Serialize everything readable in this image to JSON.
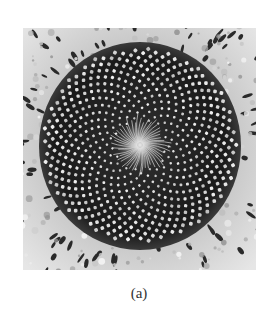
{
  "figure": {
    "caption": "(a)",
    "image": {
      "subject": "sunflower-head-fibonacci-spiral",
      "colors": {
        "background": "#ffffff",
        "disc_dark": "#1a1a1a",
        "floret_light": "#d8d8d8",
        "outer_ring": "#cfcfcf",
        "petal_marks": "#2a2a2a"
      },
      "spiral": {
        "golden_angle_deg": 137.508,
        "floret_count": 620
      }
    }
  }
}
